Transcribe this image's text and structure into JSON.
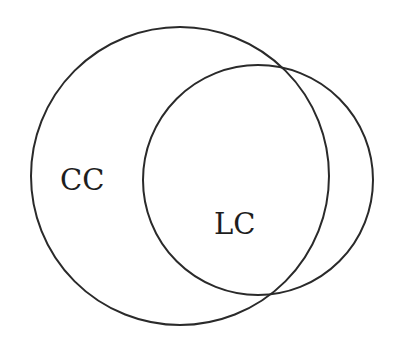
{
  "diagram": {
    "type": "venn",
    "stroke_color": "#2a2a2a",
    "background": "#ffffff",
    "sets": [
      {
        "id": "cc",
        "label": "CC",
        "circle": {
          "cx": 180,
          "cy": 176,
          "r": 149
        },
        "label_pos": {
          "x": 60,
          "y": 190
        }
      },
      {
        "id": "lc",
        "label": "LC",
        "circle": {
          "cx": 258,
          "cy": 180,
          "r": 115
        },
        "label_pos": {
          "x": 214,
          "y": 234
        }
      }
    ]
  }
}
